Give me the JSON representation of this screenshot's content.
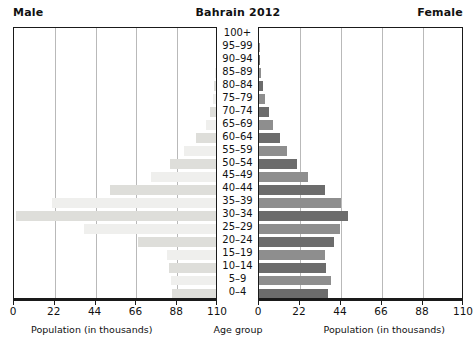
{
  "header": {
    "male_label": "Male",
    "title": "Bahrain 2012",
    "female_label": "Female"
  },
  "axis": {
    "left_caption": "Population (in thousands)",
    "right_caption": "Population (in thousands)",
    "center_label": "Age group",
    "ticks": [
      "110",
      "88",
      "66",
      "44",
      "22",
      "0"
    ],
    "ticks_right": [
      "0",
      "22",
      "44",
      "66",
      "88",
      "110"
    ]
  },
  "colors": {
    "male_bar_dark": "#dededa",
    "male_bar_light": "#efefed",
    "female_bar_dark": "#6c6c6c",
    "female_bar_light": "#8e8e8e",
    "grid": "#b9b9b9",
    "frame": "#1a1a1a",
    "background": "#ffffff"
  },
  "chart_data": {
    "type": "bar",
    "subtype": "population-pyramid",
    "title": "Bahrain 2012",
    "xlabel": "Population (in thousands)",
    "ylabel": "Age group",
    "xlim": [
      0,
      110
    ],
    "xticks": [
      0,
      22,
      44,
      66,
      88,
      110
    ],
    "grid": true,
    "legend": [
      "Male",
      "Female"
    ],
    "legend_position": "top-left and top-right",
    "categories": [
      "100+",
      "95–99",
      "90–94",
      "85–89",
      "80–84",
      "75–79",
      "70–74",
      "65–69",
      "60–64",
      "55–59",
      "50–54",
      "45–49",
      "40–44",
      "35–39",
      "30–34",
      "25–29",
      "20–24",
      "15–19",
      "10–14",
      "5–9",
      "0–4"
    ],
    "series": [
      {
        "name": "Male",
        "side": "left",
        "values": [
          0.0,
          0.1,
          0.2,
          0.5,
          0.9,
          1.6,
          3.4,
          5.5,
          11.0,
          17.5,
          25.0,
          35.0,
          57.0,
          88.5,
          108.0,
          71.0,
          42.0,
          26.5,
          25.5,
          24.5,
          24.0
        ]
      },
      {
        "name": "Female",
        "side": "right",
        "values": [
          0.0,
          0.1,
          0.3,
          1.0,
          2.1,
          3.4,
          5.5,
          7.5,
          11.5,
          15.0,
          20.5,
          26.5,
          35.5,
          44.0,
          47.5,
          43.5,
          40.0,
          35.5,
          36.0,
          38.5,
          37.0
        ]
      }
    ]
  }
}
